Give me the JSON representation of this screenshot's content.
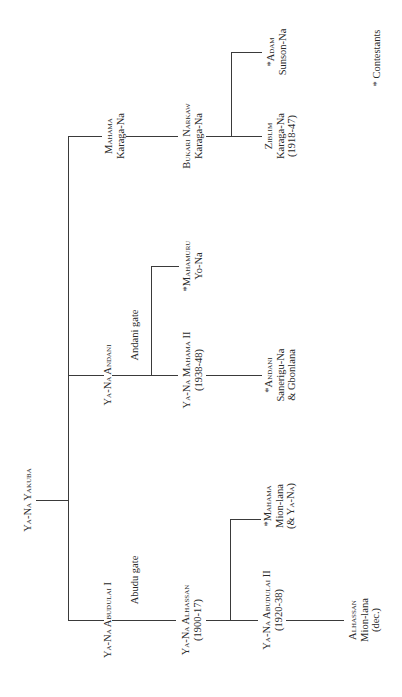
{
  "diagram": {
    "root": {
      "name": "Ya-Na Yakuba"
    },
    "gates": {
      "abudu": "Abudu gate",
      "andani": "Andani gate"
    },
    "nodes": {
      "abdulai1": {
        "name": "Ya-Na Abudulai I"
      },
      "andani": {
        "name": "Ya-Na Andani"
      },
      "mahama_karaga": {
        "name": "Mahama",
        "title": "Karaga-Na"
      },
      "alhassan": {
        "name": "Ya-Na Alhassan",
        "dates": "(1900-17)"
      },
      "abdulai2": {
        "name": "Ya-Na Abudulai II",
        "dates": "(1920-38)"
      },
      "mahama_mion": {
        "name": "*Mahama",
        "title": "Mion-lana",
        "note": "(& Ya-Na)"
      },
      "alhassan_mion": {
        "name": "Alhassan",
        "title": "Mion-lana",
        "note": "(dec.)"
      },
      "mahama2": {
        "name": "Ya-Na Mahama II",
        "dates": "(1938-48)"
      },
      "mahamuru": {
        "name": "*Mahamuru",
        "title": "Yo-Na"
      },
      "andani_sanerigu": {
        "name": "*Andani",
        "title": "Sanerigu-Na",
        "note": "& Gbonlana"
      },
      "bukari": {
        "name": "Bukari Narkaw",
        "title": "Karaga-Na"
      },
      "ziblim": {
        "name": "Ziblim",
        "title": "Karaga-Na",
        "dates": "(1918-47)"
      },
      "adam": {
        "name": "*Adam",
        "title": "Sunson-Na"
      }
    },
    "legend": "* Contestants"
  }
}
